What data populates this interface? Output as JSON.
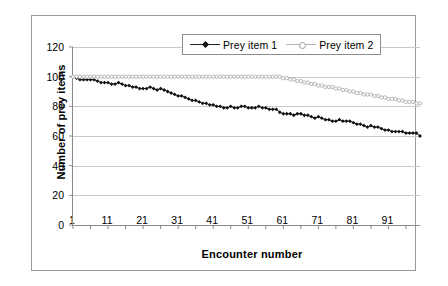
{
  "chart_data": {
    "type": "line",
    "title": "",
    "xlabel": "Encounter number",
    "ylabel": "Number of prey items",
    "xlim": [
      1,
      100
    ],
    "ylim": [
      0,
      120
    ],
    "ytick_values": [
      0,
      20,
      40,
      60,
      80,
      100,
      120
    ],
    "xtick_values": [
      1,
      11,
      21,
      31,
      41,
      51,
      61,
      71,
      81,
      91
    ],
    "grid": true,
    "legend_position": "top-center",
    "x": [
      1,
      2,
      3,
      4,
      5,
      6,
      7,
      8,
      9,
      10,
      11,
      12,
      13,
      14,
      15,
      16,
      17,
      18,
      19,
      20,
      21,
      22,
      23,
      24,
      25,
      26,
      27,
      28,
      29,
      30,
      31,
      32,
      33,
      34,
      35,
      36,
      37,
      38,
      39,
      40,
      41,
      42,
      43,
      44,
      45,
      46,
      47,
      48,
      49,
      50,
      51,
      52,
      53,
      54,
      55,
      56,
      57,
      58,
      59,
      60,
      61,
      62,
      63,
      64,
      65,
      66,
      67,
      68,
      69,
      70,
      71,
      72,
      73,
      74,
      75,
      76,
      77,
      78,
      79,
      80,
      81,
      82,
      83,
      84,
      85,
      86,
      87,
      88,
      89,
      90,
      91,
      92,
      93,
      94,
      95,
      96,
      97,
      98,
      99,
      100
    ],
    "series": [
      {
        "name": "Prey item 1",
        "marker": "filled-diamond",
        "color": "#111111",
        "values": [
          100,
          99,
          98,
          98,
          98,
          98,
          98,
          97,
          96,
          96,
          96,
          95,
          95,
          96,
          95,
          94,
          94,
          93,
          93,
          92,
          92,
          92,
          93,
          92,
          91,
          92,
          91,
          90,
          89,
          88,
          87,
          87,
          86,
          85,
          84,
          84,
          83,
          82,
          82,
          81,
          81,
          80,
          80,
          79,
          79,
          80,
          79,
          79,
          80,
          80,
          79,
          79,
          79,
          80,
          79,
          79,
          78,
          78,
          78,
          76,
          75,
          75,
          75,
          74,
          75,
          75,
          74,
          74,
          73,
          72,
          73,
          72,
          71,
          71,
          70,
          70,
          71,
          70,
          70,
          70,
          69,
          68,
          68,
          67,
          66,
          67,
          66,
          66,
          65,
          64,
          64,
          63,
          63,
          63,
          63,
          62,
          62,
          62,
          62,
          60
        ]
      },
      {
        "name": "Prey item 2",
        "marker": "open-circle",
        "color": "#b0b0b0",
        "values": [
          100,
          100,
          100,
          100,
          100,
          100,
          100,
          100,
          100,
          100,
          100,
          100,
          100,
          100,
          100,
          100,
          100,
          100,
          100,
          100,
          100,
          100,
          100,
          100,
          100,
          100,
          100,
          100,
          100,
          100,
          100,
          100,
          100,
          100,
          100,
          100,
          100,
          100,
          100,
          100,
          100,
          100,
          100,
          100,
          100,
          100,
          100,
          100,
          100,
          100,
          100,
          100,
          100,
          100,
          100,
          100,
          100,
          100,
          100,
          100,
          99,
          99,
          98,
          98,
          97,
          97,
          96,
          96,
          95,
          95,
          94,
          94,
          93,
          93,
          93,
          92,
          92,
          91,
          91,
          90,
          90,
          89,
          89,
          88,
          88,
          88,
          87,
          87,
          86,
          86,
          85,
          85,
          85,
          84,
          84,
          83,
          83,
          83,
          82,
          82
        ]
      }
    ]
  },
  "legend": {
    "items": [
      {
        "label": "Prey item 1"
      },
      {
        "label": "Prey item 2"
      }
    ]
  }
}
